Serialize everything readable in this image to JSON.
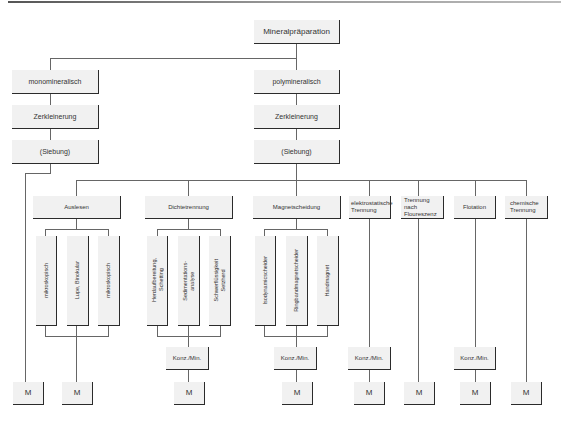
{
  "root": "Mineralpräparation",
  "branches": {
    "mono": {
      "label": "monomineralisch",
      "steps": [
        "Zerkleinerung",
        "(Siebung)"
      ],
      "result": "M"
    },
    "poly": {
      "label": "polymineralisch",
      "steps": [
        "Zerkleinerung",
        "(Siebung)"
      ]
    }
  },
  "methods": [
    {
      "label": "Auslesen",
      "subs": [
        "mikroskopisch",
        "Lupe, Binokular",
        "mikroskopisch"
      ],
      "result": "M"
    },
    {
      "label": "Dichtetrennung",
      "subs": [
        "Herdaufbereitung,\nSchetting",
        "Sedimentations-\nanalyse",
        "Schwerflüssigkeit\nSetzherd"
      ],
      "conc": "Konz./Min.",
      "result": "M"
    },
    {
      "label": "Magnetscheidung",
      "subs": [
        "Isodynamicscheider",
        "Ringbandmagnetscheider",
        "Handmagnet"
      ],
      "conc": "Konz./Min.",
      "result": "M"
    },
    {
      "label": "elektrostatische\nTrennung",
      "conc": "Konz./Min.",
      "result": "M"
    },
    {
      "label": "Trennung nach\nFloureszenz",
      "result": "M"
    },
    {
      "label": "Flotation",
      "conc": "Konz./Min.",
      "result": "M"
    },
    {
      "label": "chemische\nTrennung",
      "result": "M"
    }
  ]
}
